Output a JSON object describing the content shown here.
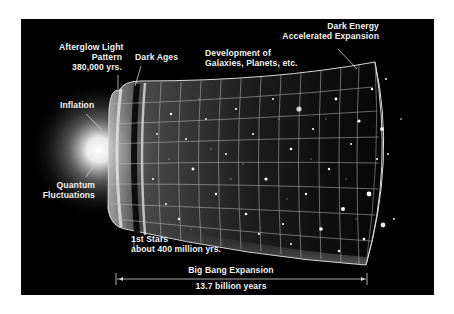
{
  "diagram": {
    "colors": {
      "background": "#000000",
      "page": "#ffffff",
      "text": "#f2f2f2",
      "glow": "#ffffff"
    },
    "labels": {
      "afterglow": {
        "line1": "Afterglow Light",
        "line2": "Pattern",
        "line3": "380,000 yrs."
      },
      "dark_ages": "Dark Ages",
      "development": {
        "line1": "Development of",
        "line2": "Galaxies, Planets, etc."
      },
      "dark_energy": {
        "line1": "Dark Energy",
        "line2": "Accelerated Expansion"
      },
      "inflation": "Inflation",
      "quantum": {
        "line1": "Quantum",
        "line2": "Fluctuations"
      },
      "first_stars": {
        "line1": "1st Stars",
        "line2": "about 400 million yrs."
      },
      "expansion": "Big Bang Expansion",
      "duration": "13.7 billion years"
    }
  }
}
